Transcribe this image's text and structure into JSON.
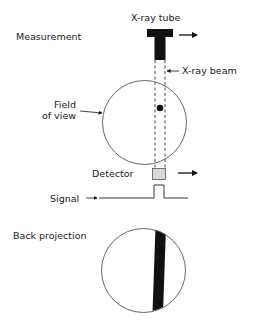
{
  "labels": {
    "section_measurement": "Measurement",
    "xray_tube": "X-ray tube",
    "xray_beam": "X-ray beam",
    "field_of_view_line1": "Field",
    "field_of_view_line2": "of view",
    "detector": "Detector",
    "signal": "Signal",
    "section_back_projection": "Back projection"
  },
  "colors": {
    "ink": "#111111",
    "detector_fill": "#d8d8d8",
    "circle_stroke": "#555555"
  }
}
